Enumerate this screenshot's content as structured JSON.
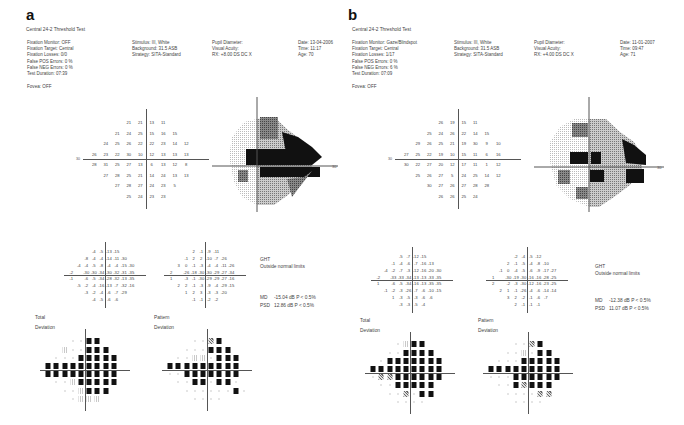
{
  "panels": [
    {
      "letter": "a",
      "test_title": "Central 24-2 Threshold Test",
      "col1": [
        "Fixation Monitor: OFF",
        "Fixation Target: Central",
        "Fixation Losses: 0/0",
        "False POS Errors:   0 %",
        "False NEG Errors:   0 %",
        "Test Duration: 07:39"
      ],
      "fovea": "Fovea: OFF",
      "col2": [
        "Stimulus: III, White",
        "Background: 31.5 ASB",
        "Strategy: SITA-Standard"
      ],
      "col3": [
        "Pupil Diameter:",
        "Visual Acuity:",
        "RX: +8.00 DS        DC  X"
      ],
      "col4": [
        "Date: 13-04-2006",
        "Time: 11:17",
        "Age: 70"
      ],
      "axis_label": "30",
      "threshold_rows": [
        [
          "21",
          "21",
          "13",
          "11"
        ],
        [
          "21",
          "24",
          "25",
          "15",
          "16",
          "15"
        ],
        [
          "24",
          "25",
          "26",
          "22",
          "22",
          "23",
          "14",
          "12"
        ],
        [
          "26",
          "23",
          "22",
          "30",
          "10",
          "12",
          "13",
          "13",
          "13"
        ],
        [
          "28",
          "31",
          "25",
          "27",
          "13",
          "6",
          "13",
          "12",
          "8"
        ],
        [
          "27",
          "28",
          "25",
          "21",
          "14",
          "24",
          "13",
          "13"
        ],
        [
          "27",
          "28",
          "27",
          "24",
          "23",
          "5"
        ],
        [
          "25",
          "24",
          "23",
          "23"
        ]
      ],
      "total_dev_rows": [
        [
          "-4",
          "-5",
          "-13",
          "-15"
        ],
        [
          "-8",
          "-4",
          "-4",
          "-14",
          "-11",
          "-30"
        ],
        [
          "-4",
          "-4",
          "-5",
          "-8",
          "-4",
          "-4",
          "-15",
          "-30"
        ],
        [
          "-2",
          "",
          "-30",
          "-30",
          "-34",
          "-30",
          "-32",
          "-31",
          "-35"
        ],
        [
          "-1",
          "",
          "-6",
          "-5",
          "-34",
          "-28",
          "-32",
          "-13",
          "-35"
        ],
        [
          "-5",
          "-2",
          "-4",
          "-16",
          "-13",
          "-7",
          "-32",
          "-16"
        ],
        [
          "-3",
          "-2",
          "-4",
          "-6",
          "-7",
          "-29"
        ],
        [
          "-4",
          "-5",
          "-6",
          "-6"
        ]
      ],
      "pattern_dev_rows": [
        [
          "2",
          "-1",
          "-9",
          "-11"
        ],
        [
          "-1",
          "2",
          "2",
          "-10",
          "-7",
          "-26"
        ],
        [
          "3",
          "0",
          "-1",
          "-3",
          "-4",
          "-4",
          "-11",
          "-26"
        ],
        [
          "2",
          "",
          "-26",
          "-18",
          "-30",
          "-30",
          "-29",
          "-27",
          "-34"
        ],
        [
          "1",
          "",
          "-3",
          "-1",
          "-30",
          "-29",
          "-29",
          "-27",
          "-16"
        ],
        [
          "2",
          "2",
          "-1",
          "-3",
          "-9",
          "-4",
          "-29",
          "-15"
        ],
        [
          "1",
          "2",
          "3",
          "-3",
          "-3",
          "-20"
        ],
        [
          "-1",
          "-1",
          "-2",
          "-2"
        ]
      ],
      "ght_label": "GHT",
      "ght_value": "Outside normal limits",
      "md": {
        "label": "MD",
        "value": "-15.04 dB  P < 0.5%"
      },
      "psd": {
        "label": "PSD",
        "value": "12.86 dB  P < 0.5%"
      },
      "total_label": [
        "Total",
        "Deviation"
      ],
      "pattern_label": [
        "Pattern",
        "Deviation"
      ]
    },
    {
      "letter": "b",
      "test_title": "Central 24-2 Threshold Test",
      "col1": [
        "Fixation Monitor: Gaze/Blindspot",
        "Fixation Target: Central",
        "Fixation Losses: 1/17",
        "False POS Errors:   0 %",
        "False NEG Errors:   6 %",
        "Test Duration: 07:09"
      ],
      "fovea": "Fovea: OFF",
      "col2": [
        "Stimulus: III, White",
        "Background: 31.5 ASB",
        "Strategy: SITA-Standard"
      ],
      "col3": [
        "Pupil Diameter:",
        "Visual Acuity:",
        "RX: +4.00 DS        DC  X"
      ],
      "col4": [
        "Date: 11-01-2007",
        "Time: 09:47",
        "Age: 71"
      ],
      "axis_label": "30",
      "threshold_rows": [
        [
          "26",
          "19",
          "15",
          "11"
        ],
        [
          "25",
          "24",
          "26",
          "22",
          "14",
          "15"
        ],
        [
          "29",
          "26",
          "25",
          "21",
          "19",
          "30",
          "9",
          "10"
        ],
        [
          "27",
          "25",
          "22",
          "19",
          "10",
          "15",
          "11",
          "6",
          "16"
        ],
        [
          "30",
          "22",
          "27",
          "20",
          "12",
          "17",
          "11",
          "1",
          "12"
        ],
        [
          "25",
          "26",
          "27",
          "5",
          "24",
          "25",
          "14",
          "12"
        ],
        [
          "30",
          "27",
          "26",
          "27",
          "28",
          "28"
        ],
        [
          "26",
          "26",
          "25",
          "24"
        ]
      ],
      "total_dev_rows": [
        [
          "-5",
          "-7",
          "-12",
          "-15"
        ],
        [
          "-1",
          "-4",
          "-6",
          "-7",
          "-16",
          "-13"
        ],
        [
          "-4",
          "-2",
          "-7",
          "-3",
          "-12",
          "-16",
          "-20",
          "-30"
        ],
        [
          "-2",
          "",
          "-33",
          "-33",
          "-34",
          "-13",
          "-13",
          "-33",
          "-35"
        ],
        [
          "1",
          "",
          "-6",
          "-5",
          "-34",
          "-16",
          "-13",
          "-35",
          "-35"
        ],
        [
          "-1",
          "-2",
          "-3",
          "-26",
          "-7",
          "-6",
          "-10",
          "-15"
        ],
        [
          "1",
          "-3",
          "-5",
          "-3",
          "-6",
          "-6"
        ],
        [
          "-3",
          "-3",
          "-5",
          "-4"
        ]
      ],
      "pattern_dev_rows": [
        [
          "-2",
          "-4",
          "-5",
          "-12"
        ],
        [
          "2",
          "-1",
          "-5",
          "-4",
          "-8",
          "-10"
        ],
        [
          "-1",
          "0",
          "-4",
          "-5",
          "-6",
          "-9",
          "-17",
          "-27"
        ],
        [
          "1",
          "",
          "-30",
          "-19",
          "-30",
          "-16",
          "-16",
          "-28",
          "-25"
        ],
        [
          "2",
          "",
          "-2",
          "-3",
          "-30",
          "-12",
          "-16",
          "-23",
          "-25"
        ],
        [
          "2",
          "1",
          "-1",
          "-26",
          "-4",
          "-6",
          "-14",
          "-14"
        ],
        [
          "3",
          "2",
          "-2",
          "-1",
          "-6",
          "-7"
        ],
        [
          "2",
          "-1",
          "-1",
          "-1"
        ]
      ],
      "ght_label": "GHT",
      "ght_value": "Outside normal limits",
      "md": {
        "label": "MD",
        "value": "-12.38 dB  P < 0.5%"
      },
      "psd": {
        "label": "PSD",
        "value": "11.07 dB  P < 0.5%"
      },
      "total_label": [
        "Total",
        "Deviation"
      ],
      "pattern_label": [
        "Pattern",
        "Deviation"
      ]
    }
  ]
}
